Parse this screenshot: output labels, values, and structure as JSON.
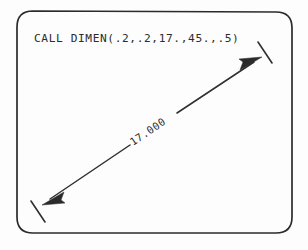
{
  "figure": {
    "name": "dimension-line-plot",
    "background_color": "#fdfdfd",
    "ink_color": "#2b2b2b",
    "frame": {
      "label": "rounded-rectangle-border",
      "corner_radius": 16
    },
    "code_label": {
      "text": "CALL DIMEN(.2,.2,17.,45.,.5)",
      "args": [
        ".2",
        ".2",
        "17.",
        "45.",
        ".5"
      ],
      "routine": "DIMEN"
    },
    "dimension": {
      "value_text": "17.000",
      "angle_degrees": 45,
      "start_point": [
        42,
        205
      ],
      "end_point": [
        262,
        57
      ],
      "arrow_start_name": "arrowhead-lower-left",
      "arrow_end_name": "arrowhead-upper-right",
      "tick_start_name": "extension-tick-lower-left",
      "tick_end_name": "extension-tick-upper-right"
    }
  }
}
